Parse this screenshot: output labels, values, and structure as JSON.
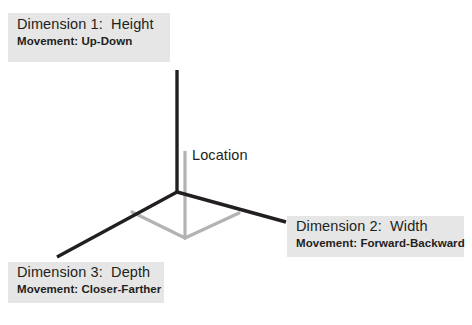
{
  "diagram": {
    "origin_label": "Location",
    "axes": [
      {
        "id": "height",
        "dimension_label": "Dimension 1:  Height",
        "movement_label": "Movement: Up-Down",
        "color": "#231f20"
      },
      {
        "id": "width",
        "dimension_label": "Dimension 2:  Width",
        "movement_label": "Movement: Forward-Backward",
        "color": "#231f20"
      },
      {
        "id": "depth",
        "dimension_label": "Dimension 3:  Depth",
        "movement_label": "Movement: Closer-Farther",
        "color": "#231f20"
      }
    ],
    "colors": {
      "axis": "#231f20",
      "projection": "#b3b3b3",
      "box_background": "#e6e6e6",
      "text": "#231f20",
      "page_background": "#ffffff"
    },
    "geometry": {
      "origin_x": 177,
      "origin_y": 192,
      "height_axis_top_y": 70,
      "width_axis_end_x": 286,
      "width_axis_end_y": 221,
      "depth_axis_end_x": 57,
      "depth_axis_end_y": 257,
      "projection_vertex_x": 185,
      "projection_vertex_y": 238,
      "projection_left_x": 132,
      "projection_left_y": 212,
      "projection_right_x": 239,
      "projection_right_y": 213,
      "vertical_guide_top_y": 151
    }
  }
}
